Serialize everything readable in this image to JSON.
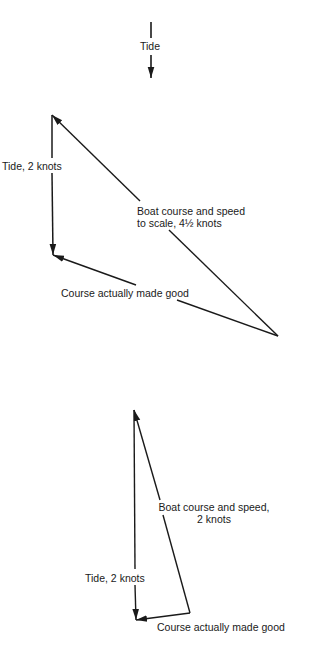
{
  "tide_indicator": {
    "label": "Tide"
  },
  "diagram_top": {
    "tide_label": "Tide, 2 knots",
    "boat_label_line1": "Boat course and speed",
    "boat_label_line2": "to scale, 4½ knots",
    "course_label": "Course actually made good"
  },
  "diagram_bottom": {
    "tide_label": "Tide, 2 knots",
    "boat_label_line1": "Boat course and speed,",
    "boat_label_line2": "2 knots",
    "course_label": "Course actually made good"
  },
  "colors": {
    "line": "#1a1a1a",
    "background": "#ffffff"
  }
}
